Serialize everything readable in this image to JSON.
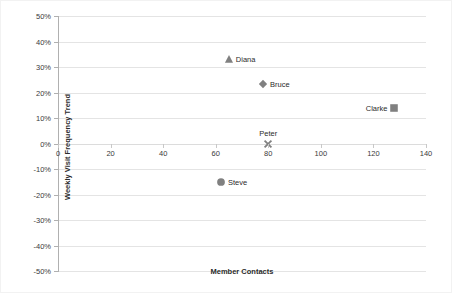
{
  "chart_data": {
    "type": "scatter",
    "title": "",
    "xlabel": "Member Contacts",
    "ylabel": "Weekly Visit Frequency Trend",
    "xlim": [
      0,
      140
    ],
    "ylim": [
      -0.5,
      0.5
    ],
    "grid": true,
    "legend": "none",
    "point_labels": true,
    "x_ticks": [
      "0",
      "20",
      "40",
      "60",
      "80",
      "100",
      "120",
      "140"
    ],
    "x_tick_values": [
      0,
      20,
      40,
      60,
      80,
      100,
      120,
      140
    ],
    "y_ticks": [
      "50%",
      "40%",
      "30%",
      "20%",
      "10%",
      "0%",
      "-10%",
      "-20%",
      "-30%",
      "-40%",
      "-50%"
    ],
    "y_tick_values": [
      0.5,
      0.4,
      0.3,
      0.2,
      0.1,
      0.0,
      -0.1,
      -0.2,
      -0.3,
      -0.4,
      -0.5
    ],
    "marker_color": "#808080",
    "points": [
      {
        "label": "Diana",
        "x": 65,
        "y": 0.33,
        "marker": "triangle",
        "label_pos": "right"
      },
      {
        "label": "Bruce",
        "x": 78,
        "y": 0.235,
        "marker": "diamond",
        "label_pos": "right"
      },
      {
        "label": "Clarke",
        "x": 128,
        "y": 0.14,
        "marker": "square",
        "label_pos": "left"
      },
      {
        "label": "Peter",
        "x": 80,
        "y": 0.0,
        "marker": "x",
        "label_pos": "top"
      },
      {
        "label": "Steve",
        "x": 62,
        "y": -0.152,
        "marker": "circle",
        "label_pos": "right"
      }
    ]
  }
}
